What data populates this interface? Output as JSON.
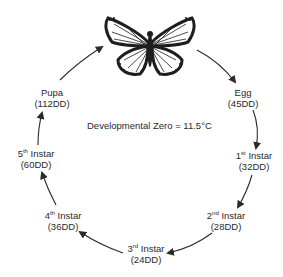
{
  "diagram": {
    "title_note": "Developmental Zero = 11.5°C",
    "stages": [
      {
        "name": "Egg",
        "sup": "",
        "dd": "(45DD)"
      },
      {
        "name": "1",
        "sup": "st",
        "suffix": " Instar",
        "dd": "(32DD)"
      },
      {
        "name": "2",
        "sup": "nd",
        "suffix": " Instar",
        "dd": "(28DD)"
      },
      {
        "name": "3",
        "sup": "rd",
        "suffix": " Instar",
        "dd": "(24DD)"
      },
      {
        "name": "4",
        "sup": "th",
        "suffix": " Instar",
        "dd": "(36DD)"
      },
      {
        "name": "5",
        "sup": "th",
        "suffix": " Instar",
        "dd": "(60DD)"
      },
      {
        "name": "Pupa",
        "sup": "",
        "dd": "(112DD)"
      }
    ],
    "center_image": "butterfly-icon",
    "colors": {
      "ink": "#2a2a2a",
      "background": "#ffffff"
    }
  }
}
